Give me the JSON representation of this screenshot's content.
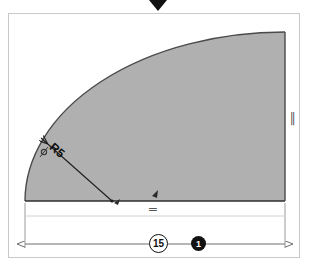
{
  "app": {
    "kind": "cad-sketch-viewport",
    "background_color": "#ffffff",
    "frame_color": "#c9c9c9"
  },
  "marker": {
    "name": "selection-pointer",
    "shape": "triangle-down",
    "color": "#111111"
  },
  "sketch": {
    "fill_color": "#b0b0b0",
    "outline_color": "#4a4a4a",
    "construction_color": "#9a9a9a",
    "dimension_color": "#6e6e6e",
    "profile_description": "quarter-round fillet profile: horizontal base, vertical right edge, large radius arc"
  },
  "dimensions": {
    "radius": {
      "label": "R5",
      "value": "5",
      "prefix": "R"
    },
    "width": {
      "circled_value": "15",
      "badge_value": "1"
    }
  },
  "constraints": [
    {
      "name": "horizontal-constraint",
      "glyph": "═"
    },
    {
      "name": "vertical-constraint",
      "glyph": "║"
    },
    {
      "name": "tangent-constraint",
      "glyph": "○"
    },
    {
      "name": "coincident-constraint",
      "glyph": "▲"
    }
  ]
}
